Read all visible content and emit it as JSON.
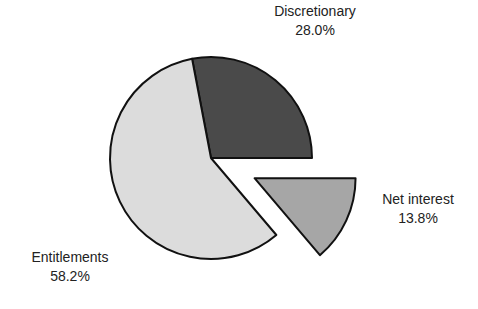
{
  "chart_data": {
    "type": "pie",
    "title": "",
    "categories": [
      "Discretionary",
      "Net interest",
      "Entitlements"
    ],
    "values": [
      28.0,
      13.8,
      58.2
    ],
    "labels": [
      "28.0%",
      "13.8%",
      "58.2%"
    ],
    "exploded": [
      "Net interest"
    ],
    "colors": [
      "#4a4a4a",
      "#a6a6a6",
      "#dcdcdc"
    ],
    "legend": "none; labels placed next to slices"
  },
  "labels": {
    "discretionary": {
      "name": "Discretionary",
      "pct": "28.0%"
    },
    "net_interest": {
      "name": "Net interest",
      "pct": "13.8%"
    },
    "entitlements": {
      "name": "Entitlements",
      "pct": "58.2%"
    }
  }
}
